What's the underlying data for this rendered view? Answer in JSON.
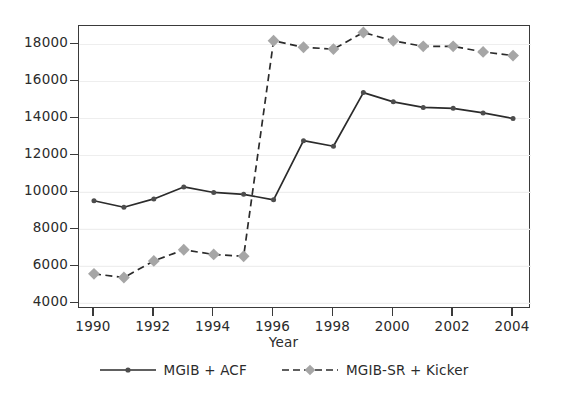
{
  "chart_data": {
    "type": "line",
    "title": "",
    "subtitle": "",
    "xlabel": "Year",
    "ylabel": "",
    "x": [
      1990,
      1991,
      1992,
      1993,
      1994,
      1995,
      1996,
      1997,
      1998,
      1999,
      2000,
      2001,
      2002,
      2003,
      2004
    ],
    "xlim": [
      1989.5,
      2004.6
    ],
    "ylim": [
      3700,
      19000
    ],
    "xticks": [
      1990,
      1992,
      1994,
      1996,
      1998,
      2000,
      2002,
      2004
    ],
    "xtick_labels": [
      "1990",
      "1992",
      "1994",
      "1996",
      "1998",
      "2000",
      "2002",
      "2004"
    ],
    "yticks": [
      4000,
      6000,
      8000,
      10000,
      12000,
      14000,
      16000,
      18000
    ],
    "ytick_labels": [
      "4000",
      "6000",
      "8000",
      "10000",
      "12000",
      "14000",
      "16000",
      "18000"
    ],
    "grid": "horizontal",
    "grid_color": "#eeeeee",
    "legend_position": "below",
    "series": [
      {
        "name": "MGIB + ACF",
        "style": "solid",
        "marker": "circle",
        "line_color": "#2b2b2b",
        "marker_color": "#4d4d4d",
        "values": [
          9550,
          9200,
          9650,
          10300,
          10000,
          9900,
          9600,
          12800,
          12500,
          15400,
          14900,
          14600,
          14550,
          14300,
          14000
        ]
      },
      {
        "name": "MGIB-SR + Kicker",
        "style": "dashed",
        "marker": "diamond",
        "line_color": "#2b2b2b",
        "marker_color": "#a6a6a6",
        "values": [
          5600,
          5400,
          6300,
          6900,
          6650,
          6550,
          18200,
          17850,
          17750,
          18650,
          18200,
          17900,
          17900,
          17600,
          17400
        ]
      }
    ]
  },
  "legend": {
    "entries": [
      {
        "label": "MGIB + ACF"
      },
      {
        "label": "MGIB-SR + Kicker"
      }
    ]
  }
}
